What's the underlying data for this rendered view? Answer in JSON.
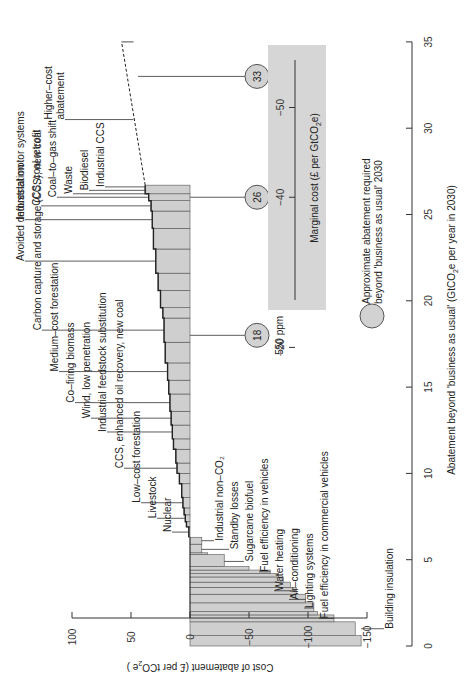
{
  "chart_data": {
    "type": "bar",
    "subtype": "marginal abatement cost curve (rotated 90° counter-clockwise)",
    "title": "",
    "xlabel": "Abatement beyond 'business as usual' (GtCO2e per year in 2030)",
    "xlabel_display": "Abatement beyond 'business as usual' (GtCO",
    "xlabel_sub": "2",
    "xlabel_tail": "e per year in 2030)",
    "ylabel": "Cost of abatement (£ per tCO2e)",
    "ylabel_display": "Cost of abatement (£ per tCO",
    "ylabel_sub": "2",
    "ylabel_tail": "e )",
    "xlim": [
      0,
      35
    ],
    "ylim": [
      -150,
      100
    ],
    "x_ticks": [
      0,
      5,
      10,
      15,
      20,
      25,
      30,
      35
    ],
    "y_ticks": [
      100,
      50,
      0,
      -50,
      -100,
      -150
    ],
    "y_tick_labels": [
      "100",
      "50",
      "0",
      "−50",
      "−100",
      "−150"
    ],
    "bars": [
      {
        "x0": 0.0,
        "x1": 0.6,
        "cost": -145
      },
      {
        "x0": 0.6,
        "x1": 1.4,
        "cost": -140
      },
      {
        "x0": 1.4,
        "x1": 1.8,
        "cost": -122
      },
      {
        "x0": 1.8,
        "x1": 2.0,
        "cost": -108
      },
      {
        "x0": 2.0,
        "x1": 2.5,
        "cost": -105
      },
      {
        "x0": 2.5,
        "x1": 3.0,
        "cost": -98
      },
      {
        "x0": 3.0,
        "x1": 3.4,
        "cost": -90
      },
      {
        "x0": 3.4,
        "x1": 3.7,
        "cost": -85
      },
      {
        "x0": 3.7,
        "x1": 4.0,
        "cost": -79
      },
      {
        "x0": 4.0,
        "x1": 4.2,
        "cost": -75
      },
      {
        "x0": 4.2,
        "x1": 4.4,
        "cost": -68
      },
      {
        "x0": 4.4,
        "x1": 4.6,
        "cost": -50
      },
      {
        "x0": 4.6,
        "x1": 5.3,
        "cost": -29
      },
      {
        "x0": 5.3,
        "x1": 5.4,
        "cost": -15
      },
      {
        "x0": 5.4,
        "x1": 5.9,
        "cost": -10
      },
      {
        "x0": 5.9,
        "x1": 6.3,
        "cost": -10
      },
      {
        "x0": 6.3,
        "x1": 6.9,
        "cost": 1
      },
      {
        "x0": 6.9,
        "x1": 7.2,
        "cost": 3
      },
      {
        "x0": 7.2,
        "x1": 7.6,
        "cost": 4
      },
      {
        "x0": 7.6,
        "x1": 8.0,
        "cost": 5
      },
      {
        "x0": 8.0,
        "x1": 8.6,
        "cost": 6
      },
      {
        "x0": 8.6,
        "x1": 9.4,
        "cost": 7
      },
      {
        "x0": 9.4,
        "x1": 10.0,
        "cost": 9
      },
      {
        "x0": 10.0,
        "x1": 10.6,
        "cost": 11
      },
      {
        "x0": 10.6,
        "x1": 11.4,
        "cost": 12
      },
      {
        "x0": 11.4,
        "x1": 12.0,
        "cost": 14
      },
      {
        "x0": 12.0,
        "x1": 12.8,
        "cost": 15
      },
      {
        "x0": 12.8,
        "x1": 13.6,
        "cost": 16
      },
      {
        "x0": 13.6,
        "x1": 14.6,
        "cost": 17
      },
      {
        "x0": 14.6,
        "x1": 15.4,
        "cost": 18
      },
      {
        "x0": 15.4,
        "x1": 16.4,
        "cost": 19
      },
      {
        "x0": 16.4,
        "x1": 17.6,
        "cost": 21
      },
      {
        "x0": 17.6,
        "x1": 19.0,
        "cost": 22
      },
      {
        "x0": 19.0,
        "x1": 19.6,
        "cost": 23
      },
      {
        "x0": 19.6,
        "x1": 20.6,
        "cost": 25
      },
      {
        "x0": 20.6,
        "x1": 21.6,
        "cost": 27
      },
      {
        "x0": 21.6,
        "x1": 23.0,
        "cost": 29
      },
      {
        "x0": 23.0,
        "x1": 24.2,
        "cost": 31
      },
      {
        "x0": 24.2,
        "x1": 25.2,
        "cost": 32
      },
      {
        "x0": 25.2,
        "x1": 25.8,
        "cost": 33
      },
      {
        "x0": 25.8,
        "x1": 26.2,
        "cost": 35
      },
      {
        "x0": 26.2,
        "x1": 26.7,
        "cost": 38
      }
    ],
    "higher_cost_extension": {
      "x0": 26.7,
      "y0": 38,
      "x1": 35,
      "y1": 58,
      "style": "dashed"
    },
    "labels": [
      {
        "text": "Building insulation",
        "x": 1.0,
        "cost": -145,
        "side": "negative"
      },
      {
        "text": "Fuel efficiency in commercial vehicles",
        "x": 1.6,
        "cost": -122,
        "side": "negative"
      },
      {
        "text": "Lighting systems",
        "x": 2.2,
        "cost": -105,
        "side": "negative"
      },
      {
        "text": "Air–conditioning",
        "x": 2.7,
        "cost": -98,
        "side": "negative"
      },
      {
        "text": "Water heating",
        "x": 3.2,
        "cost": -90,
        "side": "negative"
      },
      {
        "text": "Fuel efficiency in vehicles",
        "x": 4.3,
        "cost": -68,
        "side": "negative"
      },
      {
        "text": "Sugarcane biofuel",
        "x": 4.9,
        "cost": -29,
        "side": "negative"
      },
      {
        "text": "Standby losses",
        "x": 5.6,
        "cost": -10,
        "side": "negative"
      },
      {
        "text": "Industrial non–CO₂",
        "x": 6.1,
        "cost": -10,
        "side": "negative"
      },
      {
        "text": "Nuclear",
        "x": 6.6,
        "cost": 1,
        "side": "positive"
      },
      {
        "text": "Livestock",
        "x": 7.4,
        "cost": 4,
        "side": "positive"
      },
      {
        "text": "Low–cost forestation",
        "x": 8.3,
        "cost": 6,
        "side": "positive"
      },
      {
        "text": "CCS, enhanced oil recovery, new coal",
        "x": 10.3,
        "cost": 11,
        "side": "positive"
      },
      {
        "text": "Industrial feedstock substitution",
        "x": 12.4,
        "cost": 15,
        "side": "positive"
      },
      {
        "text": "Wind, low penetration",
        "x": 13.2,
        "cost": 16,
        "side": "positive"
      },
      {
        "text": "Co–firing biomass",
        "x": 14.1,
        "cost": 17,
        "side": "positive"
      },
      {
        "text": "Medium–cost forestation",
        "x": 15.9,
        "cost": 19,
        "side": "positive"
      },
      {
        "text": "Carbon capture and storage (CCS); new coal",
        "x": 18.3,
        "cost": 22,
        "side": "positive"
      },
      {
        "text": "Avoided deforestation",
        "x": 22.3,
        "cost": 29,
        "side": "positive"
      },
      {
        "text": "Industrial motor systems",
        "x": 24.7,
        "cost": 32,
        "side": "positive"
      },
      {
        "text": "CCS; coal retrofit",
        "x": 25.5,
        "cost": 33,
        "side": "positive"
      },
      {
        "text": "Coal–to–gas shift",
        "x": 26.0,
        "cost": 35,
        "side": "positive"
      },
      {
        "text": "Waste",
        "x": 26.2,
        "cost": 36,
        "side": "positive"
      },
      {
        "text": "Biodiesel",
        "x": 26.4,
        "cost": 37,
        "side": "positive"
      },
      {
        "text": "Industrial CCS",
        "x": 26.6,
        "cost": 38,
        "side": "positive"
      },
      {
        "text": "Higher–cost abatement",
        "x": 30.5,
        "cost": 48,
        "side": "positive"
      }
    ],
    "annotations": {
      "circles": [
        {
          "value": "18",
          "x": 18,
          "ppm": "550 ppm"
        },
        {
          "value": "26",
          "x": 26,
          "ppm": "450 ppm"
        },
        {
          "value": "33",
          "x": 33,
          "ppm": "400 ppm"
        }
      ],
      "legend_text_line1": "Approximate abatement required",
      "legend_text_line2": "beyond 'business as usual' 2030"
    },
    "marginal_cost_panel": {
      "label": "Marginal cost (£ per GtCO2e)",
      "label_display": "Marginal cost (£ per GtCO",
      "label_sub": "2",
      "label_tail": "e)",
      "ticks": [
        {
          "value": -20,
          "label": "−20",
          "x": 17.3
        },
        {
          "value": -40,
          "label": "−40",
          "x": 26.0
        },
        {
          "value": -50,
          "label": "−50",
          "x": 31.2
        }
      ]
    },
    "grid": false,
    "orientation": "rotated 90° counter-clockwise"
  },
  "labels_text": {
    "building_insulation": "Building insulation"
  }
}
